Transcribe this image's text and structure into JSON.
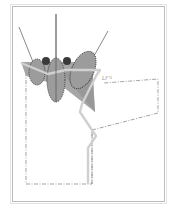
{
  "diagram": {
    "type": "orbital-schematic",
    "label": "Lf⁻¹",
    "colors": {
      "frame": "#bdbdbd",
      "plane": "#a6a6a6",
      "plane_dark": "#8f8f8f",
      "lobe": "#9c9c9c",
      "lobe_outline": "#333333",
      "sphere": "#3a3a3a",
      "rail": "#d0d0d0",
      "dashdot": "#8a8a8a",
      "axis_line": "#555555"
    },
    "lobes": [
      {
        "name": "left-lobe",
        "cx": 37,
        "cy": 72,
        "rx": 8,
        "ry": 13
      },
      {
        "name": "center-lobe",
        "cx": 56,
        "cy": 80,
        "rx": 9,
        "ry": 22
      },
      {
        "name": "right-lobe",
        "cx": 83,
        "cy": 70,
        "rx": 11,
        "ry": 20
      }
    ],
    "spheres": [
      {
        "name": "left-sphere",
        "cx": 46,
        "cy": 61,
        "r": 4
      },
      {
        "name": "right-sphere",
        "cx": 67,
        "cy": 61,
        "r": 4
      }
    ],
    "axis_lines": [
      {
        "name": "left-axis",
        "x1": 19,
        "y1": 27,
        "x2": 37,
        "y2": 72
      },
      {
        "name": "center-axis",
        "x1": 56,
        "y1": 14,
        "x2": 56,
        "y2": 102
      },
      {
        "name": "right-axis",
        "x1": 108,
        "y1": 31,
        "x2": 85,
        "y2": 72
      }
    ]
  }
}
